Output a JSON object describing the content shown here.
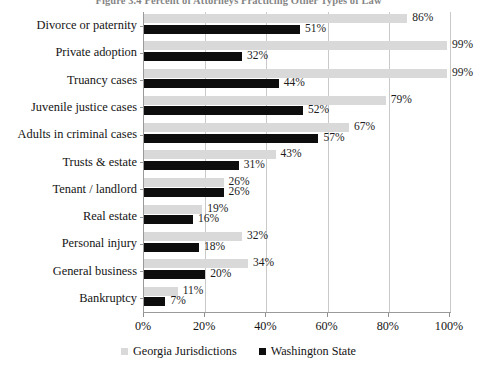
{
  "figure": {
    "title": "Figure 3.4  Percent of Attorneys Practicing Other Types of Law",
    "colors": {
      "georgia": "#d9d9d9",
      "washington": "#0d0d0d",
      "axis": "#9a9a9a",
      "grid": "#c9c9c9",
      "text": "#141414"
    }
  },
  "legend": {
    "position": "bottom-center",
    "entries": [
      {
        "label": "Georgia Jurisdictions",
        "marker": "square-gray",
        "color": "#d9d9d9"
      },
      {
        "label": "Washington State",
        "marker": "square-black",
        "color": "#0d0d0d"
      }
    ]
  },
  "axis": {
    "x_ticks": [
      "0%",
      "20%",
      "40%",
      "60%",
      "80%",
      "100%"
    ],
    "x_tick_values": [
      0,
      20,
      40,
      60,
      80,
      100
    ]
  },
  "chart_data": {
    "type": "bar",
    "orientation": "horizontal",
    "title": "Figure 3.4  Percent of Attorneys Practicing Other Types of Law",
    "xlabel": "",
    "ylabel": "",
    "xlim": [
      0,
      100
    ],
    "grid": true,
    "legend_position": "bottom-center",
    "categories": [
      "Divorce or paternity",
      "Private adoption",
      "Truancy cases",
      "Juvenile justice cases",
      "Adults in criminal cases",
      "Trusts & estate",
      "Tenant / landlord",
      "Real estate",
      "Personal injury",
      "General business",
      "Bankruptcy"
    ],
    "series": [
      {
        "name": "Georgia Jurisdictions",
        "color": "#d9d9d9",
        "values": [
          86,
          99,
          99,
          79,
          67,
          43,
          26,
          19,
          32,
          34,
          11
        ],
        "labels": [
          "86%",
          "99%",
          "99%",
          "79%",
          "67%",
          "43%",
          "26%",
          "19%",
          "32%",
          "34%",
          "11%"
        ]
      },
      {
        "name": "Washington State",
        "color": "#0d0d0d",
        "values": [
          51,
          32,
          44,
          52,
          57,
          31,
          26,
          16,
          18,
          20,
          7
        ],
        "labels": [
          "51%",
          "32%",
          "44%",
          "52%",
          "57%",
          "31%",
          "26%",
          "16%",
          "18%",
          "20%",
          "7%"
        ]
      }
    ]
  }
}
